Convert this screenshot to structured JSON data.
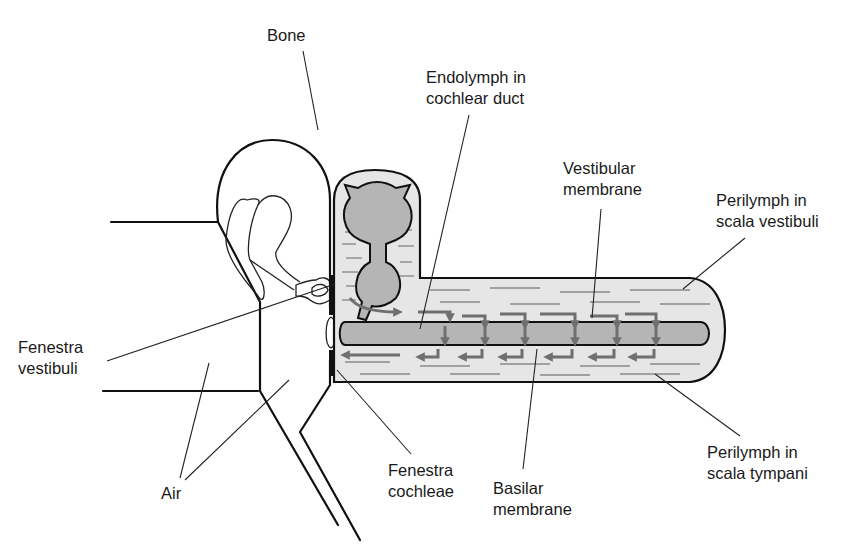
{
  "figure": {
    "colors": {
      "perilymph_fill": "#e6e6e6",
      "endolymph_duct_fill": "#b5b5b5",
      "arrow_color": "#6f6f6f",
      "outline_color": "#111111",
      "background": "#ffffff"
    }
  },
  "labels": {
    "bone": {
      "lines": [
        "Bone"
      ]
    },
    "endolymph": {
      "lines": [
        "Endolymph in",
        "cochlear duct"
      ]
    },
    "vestibular_membrane": {
      "lines": [
        "Vestibular",
        "membrane"
      ]
    },
    "perilymph_vestibuli": {
      "lines": [
        "Perilymph in",
        "scala vestibuli"
      ]
    },
    "fenestra_vestibuli": {
      "lines": [
        "Fenestra",
        "vestibuli"
      ]
    },
    "air": {
      "lines": [
        "Air"
      ]
    },
    "fenestra_cochleae": {
      "lines": [
        "Fenestra",
        "cochleae"
      ]
    },
    "basilar_membrane": {
      "lines": [
        "Basilar",
        "membrane"
      ]
    },
    "perilymph_tympani": {
      "lines": [
        "Perilymph in",
        "scala tympani"
      ]
    }
  }
}
